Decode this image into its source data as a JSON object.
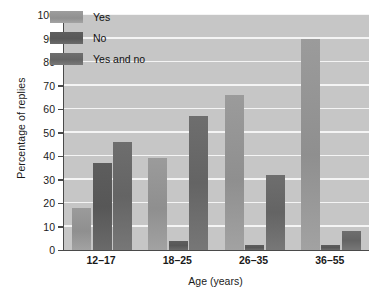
{
  "chart_data": {
    "type": "bar",
    "title": "",
    "xlabel": "Age (years)",
    "ylabel": "Percentage of replies",
    "categories": [
      "12–17",
      "18–25",
      "26–35",
      "36–55"
    ],
    "series": [
      {
        "name": "Yes",
        "color": "#9a9a9a",
        "values": [
          18,
          39,
          66,
          90
        ]
      },
      {
        "name": "No",
        "color": "#5d5d5d",
        "values": [
          37,
          4,
          2,
          2
        ]
      },
      {
        "name": "Yes and no",
        "color": "#6e6e6e",
        "values": [
          46,
          57,
          32,
          8
        ]
      }
    ],
    "ylim": [
      0,
      100
    ],
    "yticks": [
      0,
      10,
      20,
      30,
      40,
      50,
      60,
      70,
      80,
      90,
      100
    ],
    "ytick_labels": [
      "0",
      "10",
      "20",
      "30",
      "40",
      "50",
      "60",
      "70",
      "80",
      "90",
      "100"
    ],
    "grid": true,
    "grid_axis": "y",
    "grid_color": "#f4f4f4",
    "plot_background": "#c6c6c6",
    "legend_position": "upper left",
    "legend_entries": [
      "Yes",
      "No",
      "Yes and no"
    ]
  }
}
